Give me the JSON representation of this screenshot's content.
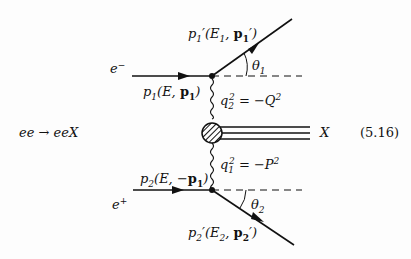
{
  "diagram": {
    "process": "ee → eeX",
    "equation_number": "(5.16)",
    "incoming_electron": {
      "particle": "e⁻",
      "momentum_label": "p₁(E, p₁)"
    },
    "incoming_positron": {
      "particle": "e⁺",
      "momentum_label": "p₂(E, −p₁)"
    },
    "outgoing_electron": {
      "momentum_label": "p′₁(E₁, p′₁)",
      "angle": "θ₁"
    },
    "outgoing_positron": {
      "momentum_label": "p′₂(E₂, p′₂)",
      "angle": "θ₂"
    },
    "photon_1": {
      "label": "q₂² = −Q²"
    },
    "photon_2": {
      "label": "q₁² = −P²"
    },
    "final_state": "X"
  },
  "text": {
    "process": "ee → eeX",
    "eqnum": "(5.16)",
    "e_minus": "e",
    "e_minus_sup": "−",
    "e_plus": "e",
    "e_plus_sup": "+",
    "theta": "θ",
    "theta1_sub": "1",
    "theta2_sub": "2",
    "X": "X"
  }
}
